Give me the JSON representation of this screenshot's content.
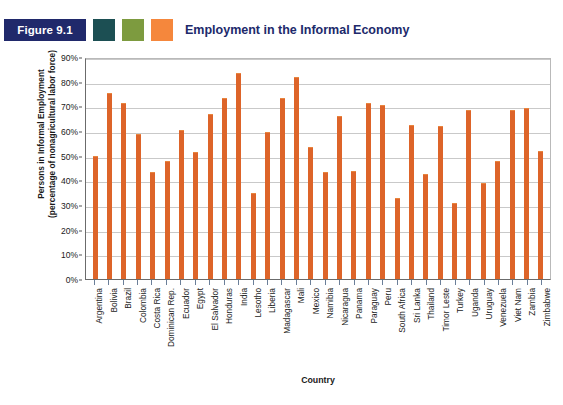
{
  "header": {
    "figure_badge": "Figure 9.1",
    "title": "Employment in the Informal Economy",
    "swatches": [
      {
        "name": "teal",
        "color": "#1c4f53"
      },
      {
        "name": "olive",
        "color": "#7d9b3f"
      },
      {
        "name": "orange",
        "color": "#f5873c"
      }
    ],
    "badge_color": "#20296b",
    "title_color": "#20296b"
  },
  "chart_data": {
    "type": "bar",
    "title": "Employment in the Informal Economy",
    "xlabel": "Country",
    "ylabel": "Persons in Informal Employment (percentage of nonagricultural labor force)",
    "ylabel_line1": "Persons in Informal Employment",
    "ylabel_line2": "(percentage of nonagricultural labor force)",
    "ylim": [
      0,
      90
    ],
    "ytick_labels": [
      "90%",
      "80%",
      "70%",
      "60%",
      "50%",
      "40%",
      "30%",
      "20%",
      "10%",
      "0%"
    ],
    "ytick_values": [
      90,
      80,
      70,
      60,
      50,
      40,
      30,
      20,
      10,
      0
    ],
    "grid": true,
    "legend": "none",
    "bar_color": "#dd6429",
    "categories": [
      "Argentina",
      "Bolivia",
      "Brazil",
      "Colombia",
      "Costa Rica",
      "Dominican Rep.",
      "Ecuador",
      "Egypt",
      "El Salvador",
      "Honduras",
      "India",
      "Lesotho",
      "Liberia",
      "Madagascar",
      "Mali",
      "Mexico",
      "Namibia",
      "Nicaragua",
      "Panama",
      "Paraguay",
      "Peru",
      "South Africa",
      "Sri Lanka",
      "Thailand",
      "Timor Leste",
      "Turkey",
      "Uganda",
      "Uruguay",
      "Venezuela",
      "Viet Nam",
      "Zambia",
      "Zimbabwe"
    ],
    "values": [
      49.5,
      75.0,
      71.0,
      58.5,
      43.0,
      47.5,
      60.0,
      51.0,
      66.5,
      73.0,
      83.0,
      34.5,
      59.0,
      73.0,
      81.5,
      53.0,
      43.0,
      65.5,
      43.5,
      71.0,
      70.0,
      32.5,
      62.0,
      42.0,
      61.5,
      30.5,
      68.0,
      38.5,
      47.5,
      68.0,
      69.0,
      51.5
    ]
  }
}
